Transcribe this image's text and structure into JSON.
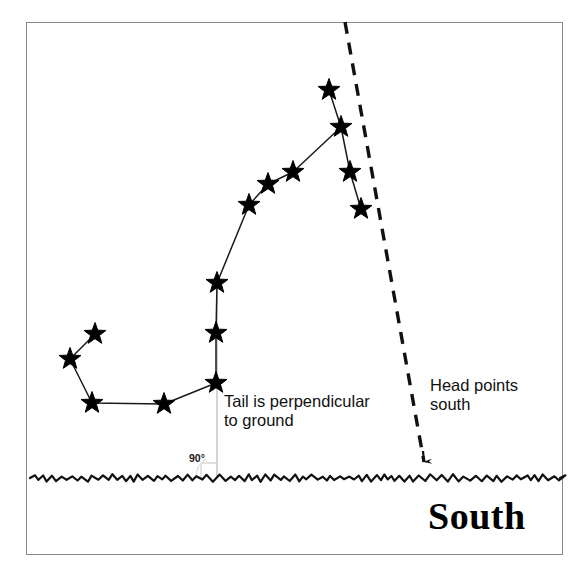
{
  "figure": {
    "frame": {
      "x": 26,
      "y": 22,
      "width": 537,
      "height": 533,
      "border_color": "#8a8a8a"
    },
    "background_color": "#ffffff",
    "ink_color": "#000000"
  },
  "annotations": {
    "tail_note": "Tail is perpendicular\nto ground",
    "head_note": "Head points\nsouth",
    "angle_label": "90°",
    "direction_label": "South"
  },
  "chart_data": {
    "type": "scatter",
    "xlabel": "",
    "ylabel": "",
    "xlim": [
      26,
      563
    ],
    "ylim": [
      555,
      22
    ],
    "grid": false,
    "legend": null,
    "coordinate_note": "Pixel coordinates in the original 588x578 image; y increases downward.",
    "series": [
      {
        "name": "Scorpius stars",
        "marker": "star",
        "marker_color": "#000000",
        "points": [
          {
            "id": "s1",
            "x": 95,
            "y": 334,
            "part": "tail-tip"
          },
          {
            "id": "s2",
            "x": 70,
            "y": 359,
            "part": "tail"
          },
          {
            "id": "s3",
            "x": 92,
            "y": 403,
            "part": "tail"
          },
          {
            "id": "s4",
            "x": 164,
            "y": 404,
            "part": "tail"
          },
          {
            "id": "s5",
            "x": 216,
            "y": 383,
            "part": "tail"
          },
          {
            "id": "s6",
            "x": 216,
            "y": 333,
            "part": "tail-vertical"
          },
          {
            "id": "s7",
            "x": 217,
            "y": 283,
            "part": "tail-vertical"
          },
          {
            "id": "s8",
            "x": 249,
            "y": 205,
            "part": "body"
          },
          {
            "id": "s9",
            "x": 268,
            "y": 184,
            "part": "body"
          },
          {
            "id": "s10",
            "x": 293,
            "y": 172,
            "part": "body"
          },
          {
            "id": "s11",
            "x": 341,
            "y": 127,
            "part": "body-junction"
          },
          {
            "id": "s12",
            "x": 329,
            "y": 90,
            "part": "head"
          },
          {
            "id": "s13",
            "x": 350,
            "y": 172,
            "part": "head"
          },
          {
            "id": "s14",
            "x": 361,
            "y": 209,
            "part": "head"
          }
        ]
      }
    ],
    "connector_lines": [
      {
        "name": "tail-chain",
        "path_ids": [
          "s1",
          "s2",
          "s3",
          "s4",
          "s5",
          "s6",
          "s7",
          "s8",
          "s9",
          "s10",
          "s11"
        ]
      },
      {
        "name": "head-chain",
        "path_ids": [
          "s12",
          "s11",
          "s13",
          "s14"
        ]
      }
    ],
    "reference_lines": [
      {
        "name": "head-points-south-dashed-line",
        "style": "dashed",
        "x1": 345,
        "y1": 22,
        "x2": 424,
        "y2": 462,
        "arrowhead": "end",
        "arrow_tip": {
          "x": 424,
          "y": 470
        }
      },
      {
        "name": "tail-perpendicular-faint-line",
        "style": "solid-faint",
        "x1": 217,
        "y1": 283,
        "x2": 217,
        "y2": 478
      }
    ],
    "ground_line": {
      "name": "ground-horizon",
      "style": "wavy",
      "y": 478,
      "x_start": 30,
      "x_end": 560
    },
    "right_angle_marker": {
      "x": 217,
      "y": 478,
      "size": 16,
      "label": "90°"
    }
  }
}
